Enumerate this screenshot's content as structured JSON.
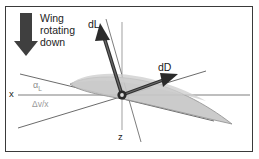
{
  "figure": {
    "background_color": "#ffffff",
    "border_color": "#3a3a3a"
  },
  "labels": {
    "wing_note": "Wing\nrotating\ndown",
    "wing_note_line1": "Wing",
    "wing_note_line2": "rotating",
    "wing_note_line3": "down",
    "lift_vector": "dL",
    "drag_vector": "dD",
    "x_axis": "x",
    "z_axis": "z",
    "angle_of_attack": "α",
    "angle_of_attack_sub": "L",
    "velocity_ratio": "Δv/x"
  },
  "colors": {
    "wing_fill": "#c9c9c9",
    "wing_stroke": "#8a8a8a",
    "vector_dark": "#2e2e2e",
    "vector_mid": "#4a4a4a",
    "axis_gray": "#a6a6a6",
    "axis_dark": "#4f4f4f",
    "rotation_arrow": "#3d3d3d",
    "hub": "#1f1f1f",
    "text": "#1a1a1a",
    "faint_text": "#949494"
  },
  "geometry": {
    "origin": {
      "x": 122,
      "y": 95
    },
    "x_axis": {
      "x1": 18,
      "y1": 95,
      "x2": 250,
      "y2": 95
    },
    "z_axis": {
      "x1": 122,
      "y1": 22,
      "x2": 122,
      "y2": 130
    },
    "chord_line": {
      "x1": 20,
      "y1": 74,
      "x2": 212,
      "y2": 120
    },
    "resultant_line": {
      "x1": 20,
      "y1": 127,
      "x2": 205,
      "y2": 72
    },
    "lift_vector": {
      "x1": 122,
      "y1": 95,
      "x2": 100,
      "y2": 27
    },
    "drag_vector": {
      "x1": 122,
      "y1": 95,
      "x2": 177,
      "y2": 75
    },
    "rotation_arrow": {
      "x": 26,
      "y_top": 13,
      "y_bottom": 55
    }
  }
}
